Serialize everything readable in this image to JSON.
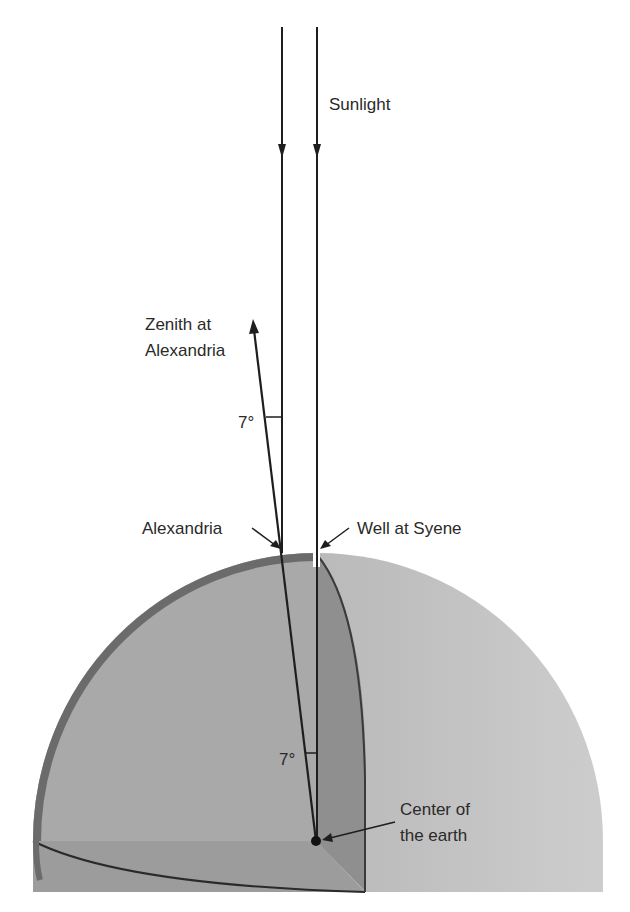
{
  "diagram": {
    "labels": {
      "sunlight": "Sunlight",
      "zenith_line1": "Zenith at",
      "zenith_line2": "Alexandria",
      "angle_upper": "7°",
      "alexandria": "Alexandria",
      "well": "Well at Syene",
      "angle_center": "7°",
      "center_line1": "Center of",
      "center_line2": "the earth"
    },
    "colors": {
      "left_face": "#a9a9a9",
      "rim": "#6b6b6b",
      "sphere": "#b3b3b3",
      "sphere_light": "#cfcfcf",
      "wedge": "#8f8f8f",
      "bottom_wedge": "#9c9c9c",
      "line": "#1e1e1e"
    }
  }
}
